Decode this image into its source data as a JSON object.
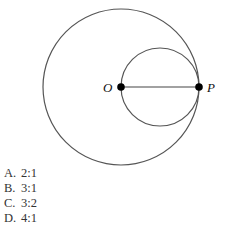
{
  "figure": {
    "large_circle": {
      "cx": 121,
      "cy": 87,
      "r": 78
    },
    "small_circle": {
      "cx": 160,
      "cy": 87,
      "r": 39
    },
    "segment": {
      "from": "O",
      "to": "P"
    },
    "points": [
      {
        "label": "O",
        "x": 121,
        "y": 87
      },
      {
        "label": "P",
        "x": 199,
        "y": 87
      }
    ],
    "stroke_color": "#555555"
  },
  "options": [
    {
      "letter": "A.",
      "text": "2:1"
    },
    {
      "letter": "B.",
      "text": "3:1"
    },
    {
      "letter": "C.",
      "text": "3:2"
    },
    {
      "letter": "D.",
      "text": "4:1"
    }
  ]
}
